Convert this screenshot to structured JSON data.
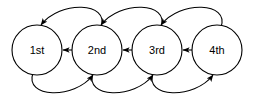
{
  "diagram": {
    "type": "state-transition-graph",
    "background_color": "#ffffff",
    "stroke_color": "#000000",
    "canvas": {
      "width": 263,
      "height": 100
    },
    "nodes": [
      {
        "id": "n1",
        "label": "1st",
        "cx": 37,
        "cy": 50,
        "r": 25
      },
      {
        "id": "n2",
        "label": "2nd",
        "cx": 97,
        "cy": 50,
        "r": 25
      },
      {
        "id": "n3",
        "label": "3rd",
        "cx": 157,
        "cy": 50,
        "r": 25
      },
      {
        "id": "n4",
        "label": "4th",
        "cx": 217,
        "cy": 50,
        "r": 25
      }
    ],
    "straight_links": [
      {
        "id": "l12",
        "from": "1st",
        "to": "2nd",
        "direction": "bidirectional",
        "x1": 63,
        "x2": 91,
        "y": 50
      },
      {
        "id": "l23",
        "from": "2nd",
        "to": "3rd",
        "direction": "bidirectional",
        "x1": 123,
        "x2": 151,
        "y": 50
      },
      {
        "id": "l34",
        "from": "3rd",
        "to": "4th",
        "direction": "bidirectional",
        "x1": 183,
        "x2": 211,
        "y": 50
      }
    ],
    "top_arcs": [
      {
        "id": "t21",
        "from": "2nd",
        "to": "1st",
        "direction": "leftward",
        "d": "M 101 27 C 110 2 60 0 41 25"
      },
      {
        "id": "t32",
        "from": "3rd",
        "to": "2nd",
        "direction": "leftward",
        "d": "M 161 27 C 170 2 120 0 101 25"
      },
      {
        "id": "t43",
        "from": "4th",
        "to": "3rd",
        "direction": "leftward",
        "d": "M 221 27 C 230 2 180 0 161 25"
      }
    ],
    "bottom_arcs": [
      {
        "id": "b12",
        "from": "1st",
        "to": "2nd",
        "direction": "rightward",
        "d": "M 33 73 C 24 98 74 100 93 75"
      },
      {
        "id": "b23",
        "from": "2nd",
        "to": "3rd",
        "direction": "rightward",
        "d": "M 93 73 C 84 98 134 100 153 75"
      },
      {
        "id": "b34",
        "from": "3rd",
        "to": "4th",
        "direction": "rightward",
        "d": "M 153 73 C 144 98 194 100 213 75"
      }
    ]
  }
}
